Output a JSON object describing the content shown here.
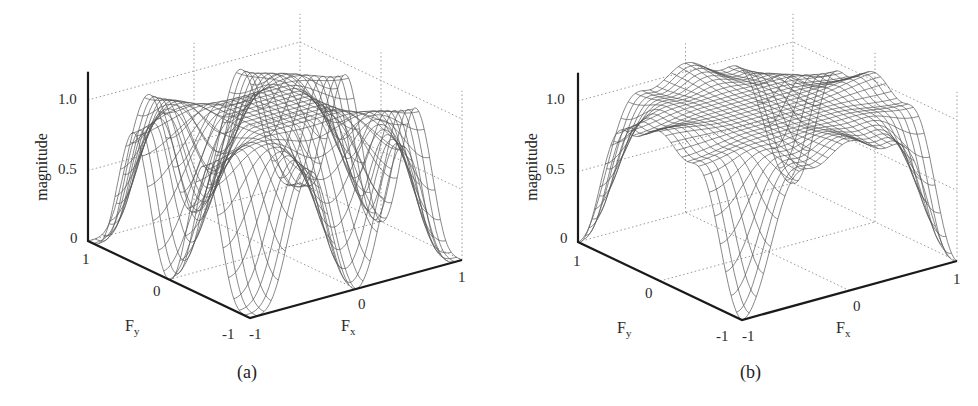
{
  "figure": {
    "panels": [
      {
        "id": "a",
        "caption": "(a)",
        "zlabel": "magnitude",
        "xlabel_main": "F",
        "xlabel_sub": "x",
        "ylabel_main": "F",
        "ylabel_sub": "y",
        "z_ticks": [
          "0",
          "0.5",
          "1.0"
        ],
        "fy_ticks": [
          "1",
          "0",
          "-1"
        ],
        "fx_ticks": [
          "-1",
          "0",
          "1"
        ]
      },
      {
        "id": "b",
        "caption": "(b)",
        "zlabel": "magnitude",
        "xlabel_main": "F",
        "xlabel_sub": "x",
        "ylabel_main": "F",
        "ylabel_sub": "y",
        "z_ticks": [
          "0",
          "0.5",
          "1.0"
        ],
        "fy_ticks": [
          "1",
          "0",
          "-1"
        ],
        "fx_ticks": [
          "-1",
          "0",
          "1"
        ]
      }
    ]
  },
  "chart_data": [
    {
      "type": "surface",
      "title": "(a)",
      "xlabel": "Fx",
      "ylabel": "Fy",
      "zlabel": "magnitude",
      "xlim": [
        -1,
        1
      ],
      "ylim": [
        -1,
        1
      ],
      "zlim": [
        0,
        1.2
      ],
      "z_ticks": [
        0,
        0.5,
        1.0
      ],
      "grid": true,
      "description": "Wireframe magnitude response, ~1 in passband center; drops to 0 at edge points Fx,Fy in {-1,0,1} along the boundary (8 notches), peaks ~1.05 near edge midpoints at +/-0.5",
      "samples": {
        "Fx": [
          -1,
          -0.5,
          0,
          0.5,
          1
        ],
        "Fy=-1": [
          0,
          1.0,
          0,
          1.0,
          0
        ],
        "Fy=0": [
          0,
          1.0,
          1.0,
          1.0,
          0
        ],
        "Fy=1": [
          0,
          1.0,
          0,
          1.0,
          0
        ]
      }
    },
    {
      "type": "surface",
      "title": "(b)",
      "xlabel": "Fx",
      "ylabel": "Fy",
      "zlabel": "magnitude",
      "xlim": [
        -1,
        1
      ],
      "ylim": [
        -1,
        1
      ],
      "zlim": [
        0,
        1.2
      ],
      "z_ticks": [
        0,
        0.5,
        1.0
      ],
      "grid": true,
      "description": "Wireframe magnitude response, ~1 across plateau with small edge ripple (~1.05 peaks, ~0.9 dips); falls to 0 only at the four corners",
      "samples": {
        "Fx": [
          -1,
          -0.5,
          0,
          0.5,
          1
        ],
        "Fy=-1": [
          0,
          0.9,
          1.0,
          0.9,
          0
        ],
        "Fy=0": [
          0.9,
          1.0,
          1.0,
          1.0,
          0.9
        ],
        "Fy=1": [
          0,
          0.9,
          1.0,
          0.9,
          0
        ]
      }
    }
  ],
  "geometry": {
    "a": {
      "corner": [
        250,
        318
      ],
      "fx_vec": [
        212,
        -58
      ],
      "fy_vec": [
        -162,
        -77
      ],
      "z_scale": 141,
      "z_top": 1.2
    },
    "b": {
      "corner": [
        742,
        320
      ],
      "fx_vec": [
        215,
        -59
      ],
      "fy_vec": [
        -164,
        -78
      ],
      "z_scale": 141,
      "z_top": 1.2
    }
  },
  "colors": {
    "mesh": "#555555",
    "axis": "#1a1a1a",
    "grid": "#9a9a9a"
  }
}
